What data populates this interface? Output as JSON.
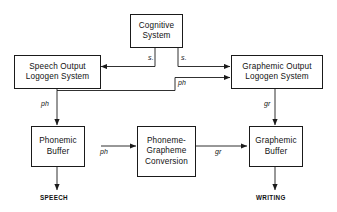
{
  "diagram": {
    "background_color": "#ffffff",
    "line_color": "#1a1a1a",
    "text_color": "#121212",
    "nodes": [
      {
        "id": "cognitive-system",
        "lines": [
          "Cognitive",
          "System"
        ]
      },
      {
        "id": "speech-output-logogen",
        "lines": [
          "Speech Output",
          "Logogen System"
        ]
      },
      {
        "id": "graphemic-output-logogen",
        "lines": [
          "Graphemic Output",
          "Logogen System"
        ]
      },
      {
        "id": "phonemic-buffer",
        "lines": [
          "Phonemic",
          "Buffer"
        ]
      },
      {
        "id": "phoneme-grapheme-conversion",
        "lines": [
          "Phoneme-",
          "Grapheme",
          "Conversion"
        ]
      },
      {
        "id": "graphemic-buffer",
        "lines": [
          "Graphemic",
          "Buffer"
        ]
      }
    ],
    "edge_labels": [
      {
        "id": "edge-label-s-left",
        "text": "s."
      },
      {
        "id": "edge-label-s-right",
        "text": "s."
      },
      {
        "id": "edge-label-ph-to-graphemic",
        "text": "ph"
      },
      {
        "id": "edge-label-ph-to-buffer",
        "text": "ph"
      },
      {
        "id": "edge-label-ph-conversion",
        "text": "ph"
      },
      {
        "id": "edge-label-gr-conversion",
        "text": "gr"
      },
      {
        "id": "edge-label-gr-vertical",
        "text": "gr"
      }
    ],
    "terminals": [
      {
        "id": "terminal-speech",
        "text": "SPEECH"
      },
      {
        "id": "terminal-writing",
        "text": "WRITING"
      }
    ]
  }
}
